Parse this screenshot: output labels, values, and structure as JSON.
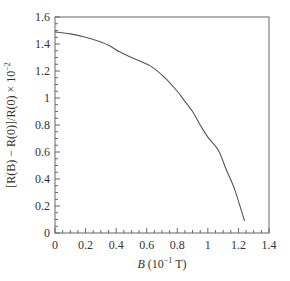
{
  "chart_data": {
    "type": "line",
    "title": "",
    "xlabel": "B (10⁻¹ T)",
    "xlabel_parts": {
      "var": "B",
      "unit_pre": " (10",
      "sup": "−1",
      "unit_post": " T)"
    },
    "ylabel": "[R(B) − R(0)]/R(0) × 10⁻²",
    "ylabel_parts": {
      "main": "[R(B) − R(0)]/R(0) × 10",
      "sup": "−2"
    },
    "xlim": [
      0,
      1.4
    ],
    "ylim": [
      0,
      1.6
    ],
    "xticks": [
      0,
      0.2,
      0.4,
      0.6,
      0.8,
      1,
      1.2,
      1.4
    ],
    "xtick_labels": [
      "0",
      "0.2",
      "0.4",
      "0.6",
      "0.8",
      "1",
      "1.2",
      "1.4"
    ],
    "yticks": [
      0,
      0.2,
      0.4,
      0.6,
      0.8,
      1,
      1.2,
      1.4,
      1.6
    ],
    "ytick_labels": [
      "0",
      "0.2",
      "0.4",
      "0.6",
      "0.8",
      "1",
      "1.2",
      "1.4",
      "1.6"
    ],
    "grid": false,
    "legend": null,
    "series": [
      {
        "name": "magnetoresistance",
        "color": "#555555",
        "x": [
          0,
          0.1,
          0.2,
          0.3,
          0.36,
          0.425,
          0.5,
          0.62,
          0.71,
          0.8,
          0.84,
          0.9,
          0.95,
          1.0,
          1.07,
          1.12,
          1.17,
          1.21,
          1.24
        ],
        "y": [
          1.49,
          1.475,
          1.45,
          1.415,
          1.385,
          1.34,
          1.3,
          1.24,
          1.16,
          1.05,
          0.99,
          0.9,
          0.8,
          0.71,
          0.61,
          0.47,
          0.34,
          0.2,
          0.09
        ]
      }
    ]
  }
}
